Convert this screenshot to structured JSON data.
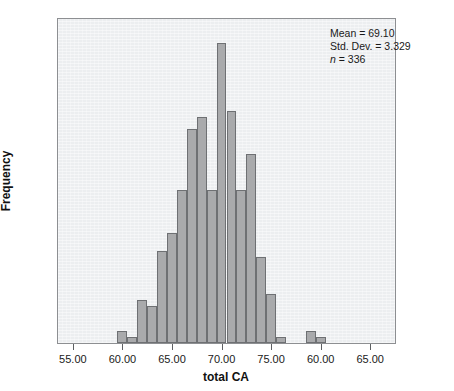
{
  "chart_data": {
    "type": "bar",
    "title": "",
    "xlabel": "total CA",
    "ylabel": "Frequency",
    "xlim": [
      53.5,
      87.5
    ],
    "ylim": [
      0,
      53
    ],
    "grid": false,
    "legend": null,
    "bin_width": 1,
    "x": [
      60,
      61,
      62,
      63,
      64,
      65,
      66,
      67,
      68,
      69,
      70,
      71,
      72,
      73,
      74,
      75,
      76,
      79,
      80
    ],
    "categories": [
      "60",
      "61",
      "62",
      "63",
      "64",
      "65",
      "66",
      "67",
      "68",
      "69",
      "70",
      "71",
      "72",
      "73",
      "74",
      "75",
      "76",
      "79",
      "80"
    ],
    "values": [
      2,
      1,
      7,
      6,
      15,
      18,
      25,
      35,
      37,
      25,
      49,
      38,
      25,
      31,
      14,
      8,
      1,
      2,
      1
    ],
    "xticks": [
      55,
      60,
      65,
      70,
      75,
      80,
      85
    ],
    "xticklabels": [
      "55.00",
      "60.00",
      "65.00",
      "70.00",
      "75.00",
      "60.00",
      "65.00"
    ],
    "yticks": [
      0,
      10,
      20,
      30,
      40,
      50
    ],
    "yticklabels": [
      "0",
      "10",
      "20",
      "30",
      "40",
      "50"
    ],
    "annotations": {
      "mean_label": "Mean = 69.10",
      "std_label": "Std. Dev. = 3.329",
      "n_symbol": "n",
      "n_label": " = 336"
    },
    "colors": {
      "bar_fill": "#a9aaac",
      "bar_edge": "#6e7073",
      "plot_background": "#eceef0",
      "frame": "#8d8f92",
      "text": "#1a1a1a"
    }
  }
}
